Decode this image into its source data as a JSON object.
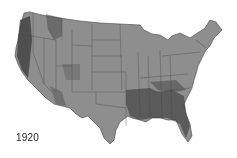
{
  "map": {
    "title": "",
    "region": "Contiguous United States",
    "fill_color": "#8e8e8e",
    "border_color": "#3a3a3a",
    "dense_color": "#2a2a2a"
  },
  "label": {
    "year": "1920"
  }
}
